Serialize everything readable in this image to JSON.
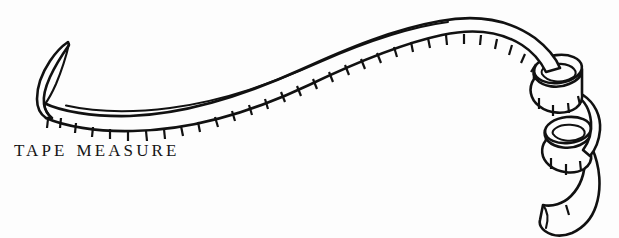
{
  "illustration": {
    "title": "tape-measure-line-drawing",
    "subject": "tape measure",
    "style": "black ink line drawing",
    "ink_color": "#111111",
    "background_color": "#fdfdfd"
  },
  "caption": {
    "word_1": "TAPE",
    "word_2": "MEASURE",
    "full_text": "TAPE MEASURE"
  },
  "parts": {
    "hook_end_label": "curled left tip",
    "ribbon_label": "measuring ribbon with graduation ticks",
    "coil_upper_label": "upper coil loop",
    "coil_lower_label": "lower coil loop",
    "trailing_end_label": "trailing tape end"
  }
}
